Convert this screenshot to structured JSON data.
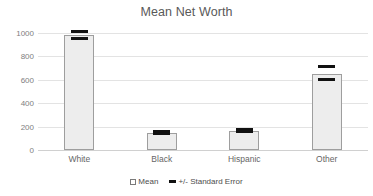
{
  "chart_data": {
    "type": "bar",
    "title": "Mean Net Worth",
    "xlabel": "",
    "ylabel": "",
    "categories": [
      "White",
      "Black",
      "Hispanic",
      "Other"
    ],
    "values": [
      980,
      145,
      165,
      650
    ],
    "error_upper": [
      1010,
      160,
      178,
      710
    ],
    "error_lower": [
      950,
      140,
      158,
      605
    ],
    "series": [
      {
        "name": "Mean",
        "values": [
          980,
          145,
          165,
          650
        ]
      },
      {
        "name": "+/- Standard Error",
        "upper": [
          1010,
          160,
          178,
          710
        ],
        "lower": [
          950,
          140,
          158,
          605
        ]
      }
    ],
    "ylim": [
      0,
      1000
    ],
    "yticks": [
      0,
      200,
      400,
      600,
      800,
      1000
    ],
    "ytick_labels": [
      "0",
      "200",
      "400",
      "600",
      "800",
      "1000"
    ],
    "grid": true,
    "legend_position": "bottom-center",
    "legend": [
      {
        "label": "Mean",
        "marker": "hollow-square",
        "color": "#ffffff"
      },
      {
        "label": "+/- Standard Error",
        "marker": "dash",
        "color": "#111111"
      }
    ],
    "colors": {
      "bar_fill": "#ededed",
      "bar_border": "#9e9e9e",
      "error": "#111111",
      "grid": "#e3e3e3",
      "title_text": "#595959",
      "tick_text": "#808080",
      "background": "#ffffff"
    }
  }
}
